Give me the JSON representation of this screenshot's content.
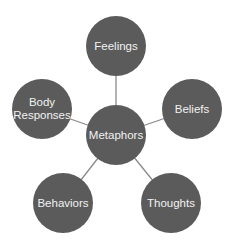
{
  "diagram": {
    "type": "hub-and-spoke",
    "colors": {
      "node_fill": "#5b5b5b",
      "node_text": "#f2f2f2",
      "link": "#8a8a8a",
      "background": "#ffffff"
    },
    "center": {
      "id": "metaphors",
      "label": "Metaphors",
      "x": 116,
      "y": 135
    },
    "nodes": [
      {
        "id": "feelings",
        "label": "Feelings",
        "x": 116,
        "y": 46
      },
      {
        "id": "body-responses",
        "label": "Body\nResponses",
        "x": 42,
        "y": 109
      },
      {
        "id": "beliefs",
        "label": "Beliefs",
        "x": 192,
        "y": 109
      },
      {
        "id": "behaviors",
        "label": "Behaviors",
        "x": 63,
        "y": 203
      },
      {
        "id": "thoughts",
        "label": "Thoughts",
        "x": 171,
        "y": 203
      }
    ],
    "edges": [
      {
        "from": "metaphors",
        "to": "feelings"
      },
      {
        "from": "metaphors",
        "to": "body-responses"
      },
      {
        "from": "metaphors",
        "to": "beliefs"
      },
      {
        "from": "metaphors",
        "to": "behaviors"
      },
      {
        "from": "metaphors",
        "to": "thoughts"
      }
    ]
  }
}
